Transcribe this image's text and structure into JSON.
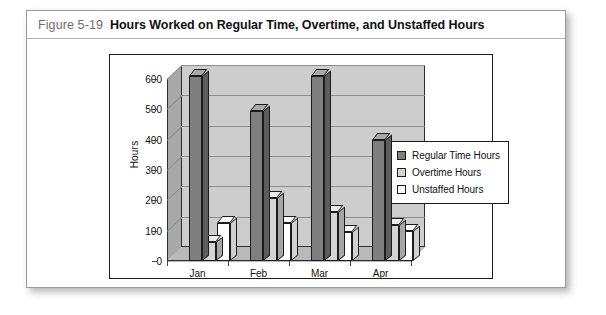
{
  "figure": {
    "number": "Figure 5-19",
    "title": "Hours Worked on Regular Time, Overtime, and Unstaffed Hours"
  },
  "chart_data": {
    "type": "bar",
    "title": "",
    "subtitle": "",
    "xlabel": "",
    "ylabel": "Hours",
    "categories": [
      "Jan",
      "Feb",
      "Mar",
      "Apr"
    ],
    "series": [
      {
        "name": "Regular Time Hours",
        "color": "#7f7f7f",
        "values": [
          610,
          495,
          610,
          400
        ]
      },
      {
        "name": "Overtime Hours",
        "color": "#d4d4d4",
        "values": [
          62,
          208,
          160,
          118
        ]
      },
      {
        "name": "Unstaffed Hours",
        "color": "#ffffff",
        "values": [
          125,
          125,
          95,
          100
        ]
      }
    ],
    "ylim": [
      0,
      600
    ],
    "yticks": [
      0,
      100,
      200,
      300,
      400,
      500,
      600
    ],
    "ytick_labels": [
      "0",
      "100",
      "200",
      "300",
      "400",
      "500",
      "600"
    ],
    "grid": true,
    "grid_axis": "y",
    "legend_position": "right",
    "three_d": true,
    "plot_background": "#cdcdcd"
  }
}
